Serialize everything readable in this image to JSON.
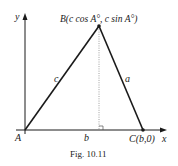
{
  "figure": {
    "caption": "Fig. 10.11",
    "axes": {
      "x_label": "x",
      "y_label": "y"
    },
    "points": {
      "A": {
        "label": "A"
      },
      "B": {
        "label": "B(c cos A°, c sin A°)"
      },
      "C": {
        "label": "C(b,0)"
      }
    },
    "sides": {
      "a": "a",
      "b": "b",
      "c": "c"
    },
    "colors": {
      "line": "#1a1a1a",
      "dotted": "#888888",
      "background": "#ffffff"
    }
  }
}
